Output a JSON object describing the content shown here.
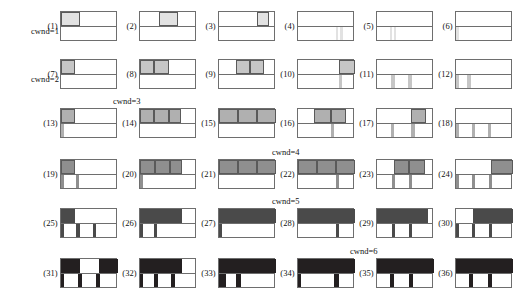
{
  "figure": {
    "type": "diagram",
    "title": "",
    "rows": 6,
    "cols": 6,
    "panel_count": 36
  },
  "row_labels": [
    {
      "text": "cwnd=1",
      "row": 1,
      "placement": "left"
    },
    {
      "text": "cwnd=2",
      "row": 2,
      "placement": "left"
    },
    {
      "text": "cwnd=3",
      "row": 3,
      "placement": "above-center-left"
    },
    {
      "text": "cwnd=4",
      "row": 4,
      "placement": "above-center"
    },
    {
      "text": "cwnd=5",
      "row": 5,
      "placement": "above-center"
    },
    {
      "text": "cwnd=6",
      "row": 6,
      "placement": "above-center"
    }
  ],
  "row_colors": [
    "#e2e2e2",
    "#c6c6c6",
    "#b0b0b0",
    "#8f8f8f",
    "#4a4a4a",
    "#231f20"
  ],
  "stroke_color": "#6e6e6e",
  "background_color": "#ffffff",
  "panel_labels": [
    "(1)",
    "(2)",
    "(3)",
    "(4)",
    "(5)",
    "(6)",
    "(7)",
    "(8)",
    "(9)",
    "(10)",
    "(11)",
    "(12)",
    "(13)",
    "(14)",
    "(15)",
    "(16)",
    "(17)",
    "(18)",
    "(19)",
    "(20)",
    "(21)",
    "(22)",
    "(23)",
    "(24)",
    "(25)",
    "(26)",
    "(27)",
    "(28)",
    "(29)",
    "(30)",
    "(31)",
    "(32)",
    "(33)",
    "(34)",
    "(35)",
    "(36)"
  ],
  "panels": [
    {
      "label": "(1)",
      "row": 1,
      "top": [
        {
          "x": 0,
          "w": 33
        }
      ],
      "bottom": []
    },
    {
      "label": "(2)",
      "row": 1,
      "top": [
        {
          "x": 33,
          "w": 33
        }
      ],
      "bottom": []
    },
    {
      "label": "(3)",
      "row": 1,
      "top": [
        {
          "x": 66,
          "w": 22
        }
      ],
      "bottom": []
    },
    {
      "label": "(4)",
      "row": 1,
      "top": [],
      "bottom": [
        {
          "x": 66,
          "w": 5
        },
        {
          "x": 74,
          "w": 5
        }
      ]
    },
    {
      "label": "(5)",
      "row": 1,
      "top": [],
      "bottom": [
        {
          "x": 22,
          "w": 5
        },
        {
          "x": 29,
          "w": 5
        }
      ]
    },
    {
      "label": "(6)",
      "row": 1,
      "top": [],
      "bottom": [
        {
          "x": 0,
          "w": 5
        }
      ]
    },
    {
      "label": "(7)",
      "row": 2,
      "top": [
        {
          "x": 0,
          "w": 25
        }
      ],
      "bottom": []
    },
    {
      "label": "(8)",
      "row": 2,
      "top": [
        {
          "x": 0,
          "w": 25
        },
        {
          "x": 25,
          "w": 25
        }
      ],
      "bottom": []
    },
    {
      "label": "(9)",
      "row": 2,
      "top": [
        {
          "x": 29,
          "w": 25
        },
        {
          "x": 54,
          "w": 25
        }
      ],
      "bottom": []
    },
    {
      "label": "(10)",
      "row": 2,
      "top": [
        {
          "x": 72,
          "w": 28
        }
      ],
      "bottom": [
        {
          "x": 72,
          "w": 6
        }
      ]
    },
    {
      "label": "(11)",
      "row": 2,
      "top": [],
      "bottom": [
        {
          "x": 25,
          "w": 6
        },
        {
          "x": 55,
          "w": 6
        }
      ]
    },
    {
      "label": "(12)",
      "row": 2,
      "top": [],
      "bottom": [
        {
          "x": 0,
          "w": 6
        },
        {
          "x": 20,
          "w": 6
        }
      ]
    },
    {
      "label": "(13)",
      "row": 3,
      "top": [
        {
          "x": 0,
          "w": 25
        }
      ],
      "bottom": [
        {
          "x": 0,
          "w": 6
        }
      ]
    },
    {
      "label": "(14)",
      "row": 3,
      "top": [
        {
          "x": 0,
          "w": 25
        },
        {
          "x": 25,
          "w": 25
        },
        {
          "x": 50,
          "w": 22
        }
      ],
      "bottom": []
    },
    {
      "label": "(15)",
      "row": 3,
      "top": [
        {
          "x": 0,
          "w": 33
        },
        {
          "x": 33,
          "w": 33
        },
        {
          "x": 66,
          "w": 34
        }
      ],
      "bottom": []
    },
    {
      "label": "(16)",
      "row": 3,
      "top": [
        {
          "x": 28,
          "w": 30
        },
        {
          "x": 58,
          "w": 26
        }
      ],
      "bottom": [
        {
          "x": 58,
          "w": 6
        }
      ]
    },
    {
      "label": "(17)",
      "row": 3,
      "top": [
        {
          "x": 60,
          "w": 26
        }
      ],
      "bottom": [
        {
          "x": 24,
          "w": 6
        },
        {
          "x": 60,
          "w": 6
        }
      ]
    },
    {
      "label": "(18)",
      "row": 3,
      "top": [],
      "bottom": [
        {
          "x": 0,
          "w": 6
        },
        {
          "x": 28,
          "w": 6
        },
        {
          "x": 56,
          "w": 6
        }
      ]
    },
    {
      "label": "(19)",
      "row": 4,
      "top": [
        {
          "x": 0,
          "w": 25
        }
      ],
      "bottom": [
        {
          "x": 0,
          "w": 6
        },
        {
          "x": 26,
          "w": 6
        }
      ]
    },
    {
      "label": "(20)",
      "row": 4,
      "top": [
        {
          "x": 0,
          "w": 26
        },
        {
          "x": 26,
          "w": 26
        },
        {
          "x": 52,
          "w": 22
        }
      ],
      "bottom": [
        {
          "x": 0,
          "w": 6
        }
      ]
    },
    {
      "label": "(21)",
      "row": 4,
      "top": [
        {
          "x": 0,
          "w": 33
        },
        {
          "x": 33,
          "w": 33
        },
        {
          "x": 66,
          "w": 34
        }
      ],
      "bottom": []
    },
    {
      "label": "(22)",
      "row": 4,
      "top": [
        {
          "x": 0,
          "w": 33
        },
        {
          "x": 33,
          "w": 33
        },
        {
          "x": 66,
          "w": 34
        }
      ],
      "bottom": [
        {
          "x": 66,
          "w": 6
        }
      ]
    },
    {
      "label": "(23)",
      "row": 4,
      "top": [
        {
          "x": 30,
          "w": 27
        },
        {
          "x": 57,
          "w": 27
        }
      ],
      "bottom": [
        {
          "x": 26,
          "w": 6
        },
        {
          "x": 56,
          "w": 6
        }
      ]
    },
    {
      "label": "(24)",
      "row": 4,
      "top": [
        {
          "x": 62,
          "w": 38
        }
      ],
      "bottom": [
        {
          "x": 0,
          "w": 6
        },
        {
          "x": 28,
          "w": 6
        },
        {
          "x": 58,
          "w": 6
        }
      ]
    },
    {
      "label": "(25)",
      "row": 5,
      "top": [
        {
          "x": 0,
          "w": 25
        }
      ],
      "bottom": [
        {
          "x": 0,
          "w": 5
        },
        {
          "x": 27,
          "w": 6
        },
        {
          "x": 56,
          "w": 6
        }
      ]
    },
    {
      "label": "(26)",
      "row": 5,
      "top": [
        {
          "x": 0,
          "w": 26
        },
        {
          "x": 26,
          "w": 26
        },
        {
          "x": 52,
          "w": 22
        }
      ],
      "bottom": [
        {
          "x": 0,
          "w": 5
        },
        {
          "x": 24,
          "w": 6
        }
      ]
    },
    {
      "label": "(27)",
      "row": 5,
      "top": [
        {
          "x": 0,
          "w": 33
        },
        {
          "x": 33,
          "w": 33
        },
        {
          "x": 66,
          "w": 34
        }
      ],
      "bottom": [
        {
          "x": 0,
          "w": 5
        }
      ]
    },
    {
      "label": "(28)",
      "row": 5,
      "top": [
        {
          "x": 0,
          "w": 32
        },
        {
          "x": 32,
          "w": 32
        },
        {
          "x": 64,
          "w": 36
        }
      ],
      "bottom": [
        {
          "x": 66,
          "w": 6
        }
      ]
    },
    {
      "label": "(29)",
      "row": 5,
      "top": [
        {
          "x": 0,
          "w": 32
        },
        {
          "x": 32,
          "w": 30
        },
        {
          "x": 62,
          "w": 28
        }
      ],
      "bottom": [
        {
          "x": 26,
          "w": 6
        },
        {
          "x": 56,
          "w": 6
        }
      ]
    },
    {
      "label": "(30)",
      "row": 5,
      "top": [
        {
          "x": 30,
          "w": 33
        },
        {
          "x": 63,
          "w": 37
        }
      ],
      "bottom": [
        {
          "x": 0,
          "w": 6
        },
        {
          "x": 28,
          "w": 6
        },
        {
          "x": 58,
          "w": 6
        }
      ]
    },
    {
      "label": "(31)",
      "row": 6,
      "top": [
        {
          "x": 0,
          "w": 33
        },
        {
          "x": 66,
          "w": 34
        }
      ],
      "bottom": [
        {
          "x": 0,
          "w": 5
        },
        {
          "x": 30,
          "w": 7
        },
        {
          "x": 62,
          "w": 7
        }
      ]
    },
    {
      "label": "(32)",
      "row": 6,
      "top": [
        {
          "x": 0,
          "w": 27
        },
        {
          "x": 27,
          "w": 27
        },
        {
          "x": 54,
          "w": 20
        }
      ],
      "bottom": [
        {
          "x": 0,
          "w": 5
        },
        {
          "x": 25,
          "w": 7
        },
        {
          "x": 54,
          "w": 7
        }
      ]
    },
    {
      "label": "(33)",
      "row": 6,
      "top": [
        {
          "x": 0,
          "w": 33
        },
        {
          "x": 33,
          "w": 33
        },
        {
          "x": 66,
          "w": 34
        }
      ],
      "bottom": [
        {
          "x": 0,
          "w": 13
        },
        {
          "x": 30,
          "w": 8
        }
      ]
    },
    {
      "label": "(34)",
      "row": 6,
      "top": [
        {
          "x": 0,
          "w": 33
        },
        {
          "x": 33,
          "w": 33
        },
        {
          "x": 66,
          "w": 34
        }
      ],
      "bottom": [
        {
          "x": 0,
          "w": 5
        },
        {
          "x": 64,
          "w": 8
        }
      ]
    },
    {
      "label": "(35)",
      "row": 6,
      "top": [
        {
          "x": 0,
          "w": 33
        },
        {
          "x": 33,
          "w": 33
        },
        {
          "x": 66,
          "w": 34
        }
      ],
      "bottom": [
        {
          "x": 22,
          "w": 8
        },
        {
          "x": 56,
          "w": 8
        }
      ]
    },
    {
      "label": "(36)",
      "row": 6,
      "top": [
        {
          "x": 0,
          "w": 33
        },
        {
          "x": 33,
          "w": 33
        },
        {
          "x": 66,
          "w": 34
        }
      ],
      "bottom": [
        {
          "x": 22,
          "w": 8
        },
        {
          "x": 56,
          "w": 8
        }
      ]
    }
  ]
}
